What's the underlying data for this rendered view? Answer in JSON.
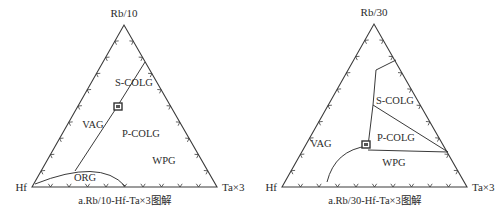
{
  "colors": {
    "line": "#3a3a3a",
    "text": "#2b2b2b",
    "background": "#ffffff"
  },
  "diagrams": [
    {
      "id": "left",
      "caption": "a.Rb/10-Hf-Ta×3图解",
      "vertices": {
        "top": {
          "label": "Rb/10",
          "x": 124,
          "y": 25
        },
        "left": {
          "label": "Hf",
          "x": 32,
          "y": 187
        },
        "right": {
          "label": "Ta×3",
          "x": 217,
          "y": 187
        }
      },
      "field_labels": [
        {
          "text": "S-COLG",
          "x": 134,
          "y": 86
        },
        {
          "text": "VAG",
          "x": 93,
          "y": 128
        },
        {
          "text": "P-COLG",
          "x": 141,
          "y": 137
        },
        {
          "text": "WPG",
          "x": 164,
          "y": 164
        },
        {
          "text": "ORG",
          "x": 85,
          "y": 181
        }
      ],
      "boundaries": [
        "M 145 62 L 115 110 L 75 171",
        "M 35 184 Q 100 158 125 186"
      ],
      "sample_marker": {
        "x": 118,
        "y": 107
      }
    },
    {
      "id": "right",
      "caption": "a.Rb/30-Hf-Ta×3图解",
      "vertices": {
        "top": {
          "label": "Rb/30",
          "x": 374,
          "y": 24
        },
        "left": {
          "label": "Hf",
          "x": 282,
          "y": 187
        },
        "right": {
          "label": "Ta×3",
          "x": 467,
          "y": 187
        }
      },
      "field_labels": [
        {
          "text": "S-COLG",
          "x": 395,
          "y": 104
        },
        {
          "text": "VAG",
          "x": 321,
          "y": 147
        },
        {
          "text": "P-COLG",
          "x": 396,
          "y": 141
        },
        {
          "text": "WPG",
          "x": 394,
          "y": 166
        },
        {
          "text": "ORG",
          "x": 0,
          "y": 0,
          "hidden": true
        }
      ],
      "boundaries": [
        "M 396 60 L 376 70 L 373 105 L 368 146",
        "M 373 105 L 448 152",
        "M 368 150 L 448 152",
        "M 368 146 Q 335 150 327 182"
      ],
      "sample_marker": {
        "x": 366,
        "y": 145
      }
    }
  ],
  "ticks_per_side": 9
}
